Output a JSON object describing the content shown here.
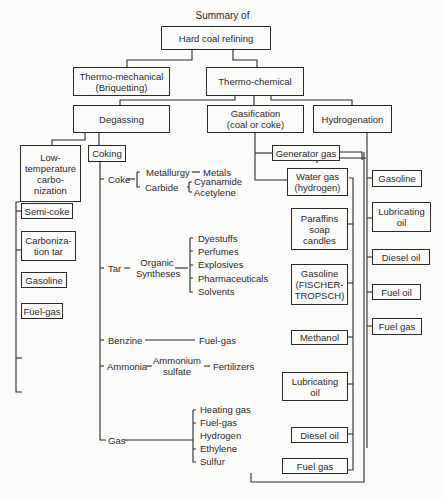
{
  "diagram": {
    "title": "Summary of",
    "root": "Hard coal refining",
    "level1": {
      "thermo_mechanical": "Thermo-mechanical\n(Briquetting)",
      "thermo_chemical": "Thermo-chemical"
    },
    "level2": {
      "degassing": "Degassing",
      "gasification": "Gasification\n(coal or coke)",
      "hydrogenation": "Hydrogenation"
    },
    "low_temp": {
      "label": "Low-\ntemperature\ncarbo-\nnization",
      "products": [
        "Semi-coke",
        "Carboniza-\ntion tar",
        "Gasoline",
        "Fuel-gas"
      ]
    },
    "coking": {
      "label": "Coking",
      "coke": {
        "label": "Coke",
        "metallurgy": "Metallurgy",
        "metals": "Metals",
        "carbide": "Carbide",
        "carbide_products": [
          "Cyanamide",
          "Acetylene"
        ]
      },
      "tar": {
        "label": "Tar",
        "organic": "Organic\nSyntheses",
        "products": [
          "Dyestuffs",
          "Perfumes",
          "Explosives",
          "Pharmaceuticals",
          "Solvents"
        ]
      },
      "benzine": {
        "label": "Benzine",
        "product": "Fuel-gas"
      },
      "ammonia": {
        "label": "Ammonia",
        "intermediate": "Ammonium\nsulfate",
        "product": "Fertilizers"
      },
      "gas": {
        "label": "Gas",
        "products": [
          "Heating gas",
          "Fuel-gas",
          "Hydrogen",
          "Ethylene",
          "Sulfur"
        ]
      }
    },
    "gasification_products": {
      "generator_gas": "Generator gas",
      "water_gas": "Water gas\n(hydrogen)",
      "synthesis": [
        "Paraffins\nsoap\ncandles",
        "Gasoline\n(FISCHER-\nTROPSCH)",
        "Methanol",
        "Lubricating\noil",
        "Diesel oil",
        "Fuel gas"
      ]
    },
    "hydrogenation_products": [
      "Gasoline",
      "Lubricating\noil",
      "Diesel oil",
      "Fuel oil",
      "Fuel gas"
    ]
  },
  "colors": {
    "line": "#2a2a2a",
    "background": "#fbfbfa"
  }
}
